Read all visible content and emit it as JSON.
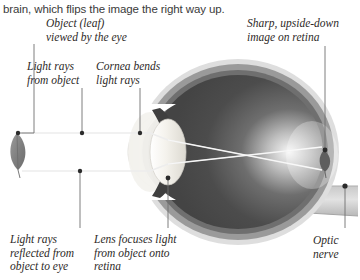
{
  "page": {
    "body_text": "brain, which flips the image the right way up.",
    "width": 360,
    "height": 280
  },
  "diagram": {
    "colors": {
      "sclera_outer": "#d8d8d8",
      "sclera_ring": "#8e8e8e",
      "vitreous_dark": "#4a4a4a",
      "lens_light": "#f2f0ea",
      "leaf_gray": "#8a8a8a",
      "ray_line": "#e9e9e9",
      "leader_line": "#6b6b6b",
      "text_dark": "#2e2a28",
      "body_text": "#3a3a3a"
    },
    "labels": [
      {
        "id": "object-leaf",
        "text": "Object (leaf)\nviewed by the eye",
        "x": 46,
        "y": 17
      },
      {
        "id": "light-rays-from-object",
        "text": "Light rays\nfrom object",
        "x": 27,
        "y": 60
      },
      {
        "id": "cornea-bends",
        "text": "Cornea bends\nlight rays",
        "x": 96,
        "y": 60
      },
      {
        "id": "sharp-upside-down",
        "text": "Sharp, upside-down\nimage on retina",
        "x": 247,
        "y": 17
      },
      {
        "id": "light-rays-reflected",
        "text": "Light rays\nreflected from\nobject to eye",
        "x": 10,
        "y": 233
      },
      {
        "id": "lens-focuses",
        "text": "Lens focuses light\nfrom object onto\nretina",
        "x": 94,
        "y": 233
      },
      {
        "id": "optic-nerve",
        "text": "Optic\nnerve",
        "x": 313,
        "y": 234
      }
    ],
    "parts": [
      "eyeball",
      "cornea",
      "lens",
      "retina",
      "optic nerve",
      "leaf object",
      "inverted retinal image",
      "light rays"
    ]
  }
}
